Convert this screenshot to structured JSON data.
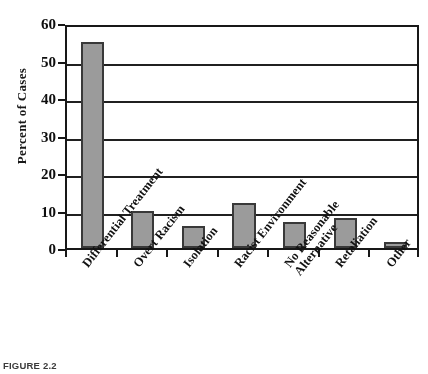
{
  "figure": {
    "caption": "FIGURE 2.2",
    "bar_color": "#9a9a9a",
    "bar_border_color": "#3a3a3a",
    "axis_color": "#1a1a1a"
  },
  "chart_data": {
    "type": "bar",
    "title": "",
    "xlabel": "",
    "ylabel": "Percent of Cases",
    "ylim": [
      0,
      60
    ],
    "yticks": [
      0,
      10,
      20,
      30,
      40,
      50,
      60
    ],
    "ytick_labels": [
      "0",
      "10",
      "20",
      "30",
      "40",
      "50",
      "60"
    ],
    "grid": true,
    "legend": "none",
    "categories": [
      "Differential Treatment",
      "Overt Racism",
      "Isolation",
      "Racist Environment",
      "No Reasonable Alternative",
      "Retaliation",
      "Other"
    ],
    "category_lines": [
      [
        "Differential Treatment"
      ],
      [
        "Overt Racism"
      ],
      [
        "Isolation"
      ],
      [
        "Racist Environment"
      ],
      [
        "No Reasonable",
        "Alternative"
      ],
      [
        "Retaliation"
      ],
      [
        "Other"
      ]
    ],
    "values": [
      55,
      10,
      6,
      12,
      7,
      8,
      1.5
    ]
  }
}
